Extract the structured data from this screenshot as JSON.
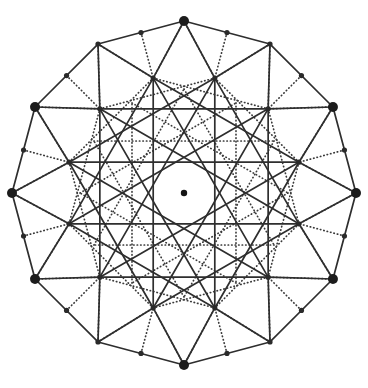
{
  "figure": {
    "kind": "geometric-diagram",
    "symmetry_order": 12,
    "canvas": {
      "width": 368,
      "height": 388,
      "background": "#ffffff"
    },
    "center": {
      "x": 184,
      "y": 193,
      "radius": 3.2,
      "color": "#141414"
    },
    "style": {
      "solid_color": "#2e2e2e",
      "dotted_color": "#3a3a3a",
      "stroke_width": 1.7,
      "dash_pattern": "0.4 3.1",
      "major_node_radius": 5.0,
      "minor_node_radius": 2.6,
      "major_node_color": "#1c1c1c",
      "minor_node_color": "#2a2a2a"
    },
    "rings": [
      {
        "name": "outer-dodecagon",
        "radius": 172,
        "count": 12,
        "phase_deg": -90,
        "node_size": "major"
      },
      {
        "name": "outer-midpoints",
        "radius": 166.1,
        "count": 12,
        "phase_deg": -75,
        "node_size": "minor"
      },
      {
        "name": "hub-ring",
        "radius": 119,
        "count": 12,
        "phase_deg": -75,
        "node_size": "minor"
      },
      {
        "name": "inner-ring",
        "radius": 104,
        "count": 12,
        "phase_deg": -90,
        "node_size": "minor"
      }
    ],
    "edge_sets": [
      {
        "name": "perimeter",
        "ring": "outer-dodecagon",
        "step": 1,
        "style": "solid"
      },
      {
        "name": "hub-spokes-long",
        "from": "outer-dodecagon",
        "to": "hub-ring",
        "style": "solid"
      },
      {
        "name": "hub-chords",
        "ring": "hub-ring",
        "step": 3,
        "style": "solid"
      },
      {
        "name": "hub-dotted-web",
        "ring": "hub-ring",
        "step": 2,
        "style": "dotted"
      },
      {
        "name": "vertex-dotted-rays",
        "from": "outer-dodecagon",
        "to": "hub-ring",
        "style": "dotted"
      },
      {
        "name": "inner-dotted-star",
        "ring": "inner-ring",
        "step": 4,
        "style": "dotted"
      }
    ]
  },
  "nodes": {
    "outer": [
      {
        "label": "v0",
        "x": 184,
        "y": 21
      },
      {
        "label": "v1",
        "x": 270,
        "y": 44
      },
      {
        "label": "v2",
        "x": 333,
        "y": 107
      },
      {
        "label": "v3",
        "x": 356,
        "y": 193
      },
      {
        "label": "v4",
        "x": 333,
        "y": 279
      },
      {
        "label": "v5",
        "x": 270,
        "y": 342
      },
      {
        "label": "v6",
        "x": 184,
        "y": 365
      },
      {
        "label": "v7",
        "x": 98,
        "y": 342
      },
      {
        "label": "v8",
        "x": 35,
        "y": 279
      },
      {
        "label": "v9",
        "x": 12,
        "y": 193
      },
      {
        "label": "v10",
        "x": 35,
        "y": 107
      },
      {
        "label": "v11",
        "x": 98,
        "y": 44
      }
    ],
    "major_marked": [
      "v0",
      "v2",
      "v3",
      "v4",
      "v6",
      "v8",
      "v9",
      "v10"
    ],
    "hub_nodes": [
      {
        "label": "h0",
        "x": 215,
        "y": 78
      },
      {
        "label": "h1",
        "x": 287,
        "y": 134
      },
      {
        "label": "h2",
        "x": 303,
        "y": 193
      },
      {
        "label": "h3",
        "x": 287,
        "y": 252
      },
      {
        "label": "h4",
        "x": 215,
        "y": 308
      },
      {
        "label": "h5",
        "x": 153,
        "y": 308
      },
      {
        "label": "h6",
        "x": 81,
        "y": 252
      },
      {
        "label": "h7",
        "x": 65,
        "y": 193
      },
      {
        "label": "h8",
        "x": 81,
        "y": 134
      },
      {
        "label": "h9",
        "x": 153,
        "y": 78
      }
    ]
  }
}
